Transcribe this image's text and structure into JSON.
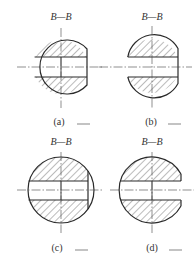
{
  "figure": {
    "views": [
      {
        "id": "a",
        "title": "B—B",
        "label": "(a)",
        "variant": "through-hole-flat-right"
      },
      {
        "id": "b",
        "title": "B—B",
        "label": "(b)",
        "variant": "open-slot-left-flat-right"
      },
      {
        "id": "c",
        "title": "B—B",
        "label": "(c)",
        "variant": "full-circle-hole-chord-right"
      },
      {
        "id": "d",
        "title": "B—B",
        "label": "(d)",
        "variant": "open-slot-right"
      }
    ],
    "colors": {
      "line": "#2a2a2a",
      "hatch": "#555555",
      "background": "#ffffff"
    }
  }
}
